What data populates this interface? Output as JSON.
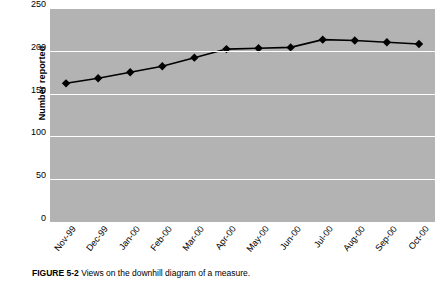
{
  "chart_data": {
    "type": "line",
    "title": "",
    "xlabel": "",
    "ylabel": "Number reported",
    "categories": [
      "Nov-99",
      "Dec-99",
      "Jan-00",
      "Feb-00",
      "Mar-00",
      "Apr-00",
      "May-00",
      "Jun-00",
      "Jul-00",
      "Aug-00",
      "Sep-00",
      "Oct-00"
    ],
    "values": [
      162,
      168,
      175,
      182,
      192,
      202,
      203,
      204,
      213,
      212,
      210,
      208
    ],
    "ylim": [
      0,
      250
    ],
    "yticks": [
      0,
      50,
      100,
      150,
      200,
      250
    ],
    "grid": true,
    "legend": "none",
    "plot_background": "#b3b3b3",
    "gridline_color": "#ffffff",
    "series_color": "#000000",
    "marker": "diamond"
  },
  "caption": {
    "label": "FIGURE 5-2",
    "text": "Views on the downhill diagram of a measure."
  }
}
